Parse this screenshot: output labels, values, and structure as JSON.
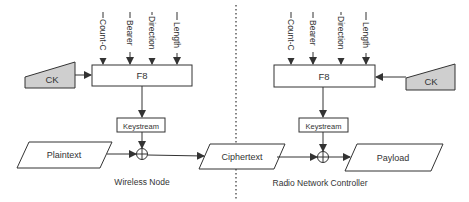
{
  "diagram": {
    "title": "",
    "colors": {
      "stroke": "#333333",
      "ck_fill": "#cfcfcf",
      "box_fill": "#ffffff",
      "divider": "#333333"
    },
    "wireless_node": {
      "label": "Wireless Node",
      "ck_label": "CK",
      "f8_label": "F8",
      "keystream_label": "Keystream",
      "inputs": [
        "Count-C",
        "Bearer",
        "Direction",
        "Length"
      ],
      "plaintext_label": "Plaintext",
      "xor_symbol": "⊕"
    },
    "ciphertext_label": "Ciphertext",
    "rnc": {
      "label": "Radio Network Controller",
      "ck_label": "CK",
      "f8_label": "F8",
      "keystream_label": "Keystream",
      "inputs": [
        "Count-C",
        "Bearer",
        "Direction",
        "Length"
      ],
      "payload_label": "Payload",
      "xor_symbol": "⊕"
    }
  }
}
